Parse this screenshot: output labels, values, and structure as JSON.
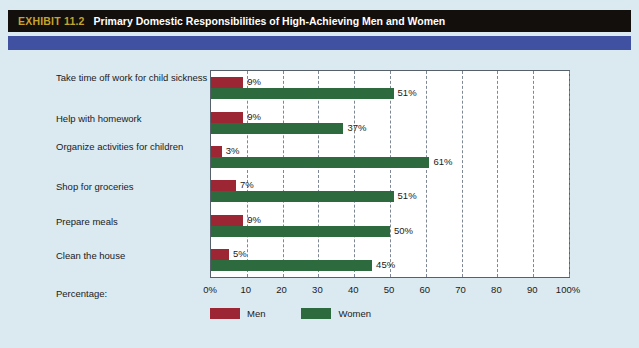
{
  "header": {
    "exhibit_tag": "EXHIBIT 11.2",
    "title": "Primary Domestic Responsibilities of High-Achieving Men and Women",
    "tag_color": "#c8a32c",
    "bar_color": "#120f0c",
    "band_color": "#3f51a0"
  },
  "axis": {
    "label": "Percentage:",
    "ticks": [
      "0%",
      "10",
      "20",
      "30",
      "40",
      "50",
      "60",
      "70",
      "80",
      "90",
      "100%"
    ]
  },
  "legend": {
    "items": [
      {
        "label": "Men",
        "color": "#9c2633"
      },
      {
        "label": "Women",
        "color": "#2d6b3f"
      }
    ]
  },
  "chart_data": {
    "type": "bar",
    "orientation": "horizontal",
    "title": "Primary Domestic Responsibilities of High-Achieving Men and Women",
    "xlabel": "Percentage:",
    "ylabel": "",
    "xlim": [
      0,
      100
    ],
    "grid": true,
    "legend_position": "bottom-left",
    "categories": [
      "Take time off work for child sickness",
      "Help with homework",
      "Organize activities for children",
      "Shop for groceries",
      "Prepare meals",
      "Clean the house"
    ],
    "series": [
      {
        "name": "Men",
        "color": "#9c2633",
        "values": [
          9,
          9,
          3,
          7,
          9,
          5
        ],
        "labels": [
          "9%",
          "9%",
          "3%",
          "7%",
          "9%",
          "5%"
        ]
      },
      {
        "name": "Women",
        "color": "#2d6b3f",
        "values": [
          51,
          37,
          61,
          51,
          50,
          45
        ],
        "labels": [
          "51%",
          "37%",
          "61%",
          "51%",
          "50%",
          "45%"
        ]
      }
    ]
  }
}
